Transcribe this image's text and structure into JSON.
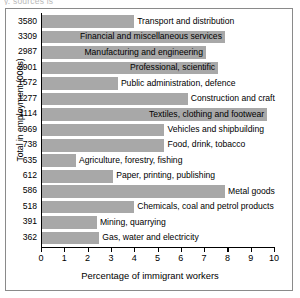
{
  "caption_remnant": "y. sources is",
  "chart_data": {
    "type": "bar",
    "orientation": "horizontal",
    "title": "",
    "xlabel": "Percentage of immigrant workers",
    "ylabel": "Total in employment (000s)",
    "xlim": [
      0,
      10
    ],
    "xticks": [
      0,
      1,
      2,
      3,
      4,
      5,
      6,
      7,
      8,
      9,
      10
    ],
    "ytick_labels": [
      "3580",
      "3309",
      "2987",
      "2901",
      "1572",
      "1277",
      "1114",
      "969",
      "738",
      "635",
      "612",
      "586",
      "518",
      "391",
      "362"
    ],
    "categories": [
      "Transport and distribution",
      "Financial and miscellaneous services",
      "Manufacturing and engineering",
      "Professional, scientific",
      "Public administration, defence",
      "Construction and craft",
      "Textiles, clothing and footwear",
      "Vehicles and shipbuilding",
      "Food, drink, tobacco",
      "Agriculture, forestry, fishing",
      "Paper, printing, publishing",
      "Metal goods",
      "Chemicals, coal and petrol products",
      "Mining, quarrying",
      "Gas, water and electricity"
    ],
    "values": [
      4.0,
      7.9,
      7.1,
      7.6,
      3.3,
      6.3,
      9.7,
      5.3,
      5.3,
      1.5,
      3.1,
      7.9,
      4.0,
      2.4,
      2.5
    ],
    "employment_totals": [
      3580,
      3309,
      2987,
      2901,
      1572,
      1277,
      1114,
      969,
      738,
      635,
      612,
      586,
      518,
      391,
      362
    ],
    "bar_color": "#a8a8a8",
    "grid": false,
    "legend": false
  }
}
